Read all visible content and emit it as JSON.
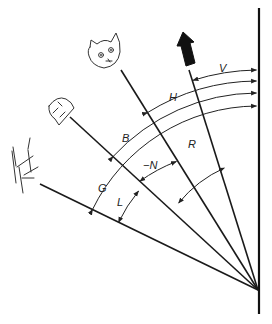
{
  "diagram": {
    "objects": [
      {
        "name": "arrow",
        "label": "upward arrow marker"
      },
      {
        "name": "cat",
        "label": "cat head"
      },
      {
        "name": "dome",
        "label": "dome/visor shape"
      },
      {
        "name": "bush",
        "label": "hatched ground object"
      }
    ],
    "outer_angles": [
      {
        "label": "V",
        "from": "arrow",
        "to": "vertical"
      },
      {
        "label": "H",
        "from": "cat",
        "to": "vertical"
      },
      {
        "label": "B",
        "from": "dome",
        "to": "vertical"
      },
      {
        "label": "G",
        "from": "bush",
        "to": "vertical"
      }
    ],
    "inner_angles": [
      {
        "label": "R",
        "from": "cat",
        "to": "arrow"
      },
      {
        "label": "−N",
        "from": "dome",
        "to": "cat"
      },
      {
        "label": "L",
        "from": "bush",
        "to": "dome"
      }
    ]
  }
}
